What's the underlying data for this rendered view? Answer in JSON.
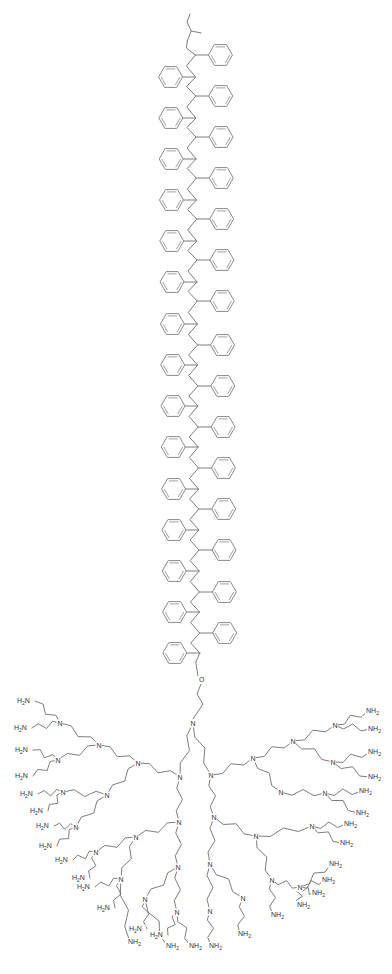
{
  "diagram": {
    "colors": {
      "bond": "#6e6e6e",
      "ring": "#8a8a8a",
      "label": "#333333",
      "background": "#ffffff"
    },
    "backbone": {
      "repeat_unit": "styrene",
      "right_phenyl_y": [
        55,
        96,
        137,
        178,
        219,
        260,
        301,
        345,
        386,
        427,
        468,
        509,
        550,
        592,
        633
      ],
      "left_phenyl_y": [
        77,
        118,
        159,
        200,
        241,
        282,
        324,
        365,
        406,
        447,
        489,
        530,
        571,
        612,
        653
      ],
      "end_group": "sec-butyl"
    },
    "linker": {
      "oxygen_label": "O",
      "x": 201,
      "y": 680
    },
    "core_nitrogen": {
      "label": "N",
      "x": 193,
      "y": 723
    },
    "nitrogen_label": "N",
    "terminal_left_label": "H2N",
    "terminal_right_label": "NH2",
    "left_amines": [
      {
        "x": 25,
        "y": 703
      },
      {
        "x": 22,
        "y": 730
      },
      {
        "x": 23,
        "y": 752
      },
      {
        "x": 23,
        "y": 778
      },
      {
        "x": 28,
        "y": 796
      },
      {
        "x": 38,
        "y": 813
      },
      {
        "x": 44,
        "y": 828
      },
      {
        "x": 47,
        "y": 848
      },
      {
        "x": 63,
        "y": 862
      },
      {
        "x": 80,
        "y": 880
      },
      {
        "x": 85,
        "y": 889
      },
      {
        "x": 105,
        "y": 910
      },
      {
        "x": 137,
        "y": 931
      },
      {
        "x": 158,
        "y": 937
      }
    ],
    "right_amines": [
      {
        "x": 372,
        "y": 713
      },
      {
        "x": 374,
        "y": 731
      },
      {
        "x": 374,
        "y": 754
      },
      {
        "x": 374,
        "y": 779
      },
      {
        "x": 365,
        "y": 793
      },
      {
        "x": 362,
        "y": 815
      },
      {
        "x": 350,
        "y": 826
      },
      {
        "x": 346,
        "y": 845
      },
      {
        "x": 335,
        "y": 866
      },
      {
        "x": 328,
        "y": 882
      },
      {
        "x": 318,
        "y": 895
      },
      {
        "x": 303,
        "y": 907
      },
      {
        "x": 277,
        "y": 917
      },
      {
        "x": 244,
        "y": 936
      },
      {
        "x": 215,
        "y": 948
      },
      {
        "x": 195,
        "y": 948
      },
      {
        "x": 172,
        "y": 948
      },
      {
        "x": 134,
        "y": 944
      }
    ],
    "branch_nitrogens": [
      {
        "x": 60,
        "y": 723
      },
      {
        "x": 99,
        "y": 745
      },
      {
        "x": 58,
        "y": 760
      },
      {
        "x": 138,
        "y": 763
      },
      {
        "x": 180,
        "y": 777
      },
      {
        "x": 107,
        "y": 795
      },
      {
        "x": 63,
        "y": 792
      },
      {
        "x": 76,
        "y": 827
      },
      {
        "x": 136,
        "y": 837
      },
      {
        "x": 179,
        "y": 822
      },
      {
        "x": 96,
        "y": 852
      },
      {
        "x": 121,
        "y": 879
      },
      {
        "x": 145,
        "y": 899
      },
      {
        "x": 178,
        "y": 867
      },
      {
        "x": 177,
        "y": 912
      },
      {
        "x": 211,
        "y": 775
      },
      {
        "x": 253,
        "y": 758
      },
      {
        "x": 293,
        "y": 741
      },
      {
        "x": 335,
        "y": 725
      },
      {
        "x": 333,
        "y": 762
      },
      {
        "x": 281,
        "y": 792
      },
      {
        "x": 325,
        "y": 793
      },
      {
        "x": 312,
        "y": 826
      },
      {
        "x": 214,
        "y": 817
      },
      {
        "x": 256,
        "y": 836
      },
      {
        "x": 272,
        "y": 880
      },
      {
        "x": 243,
        "y": 898
      },
      {
        "x": 210,
        "y": 864
      },
      {
        "x": 210,
        "y": 911
      },
      {
        "x": 300,
        "y": 887
      }
    ]
  }
}
